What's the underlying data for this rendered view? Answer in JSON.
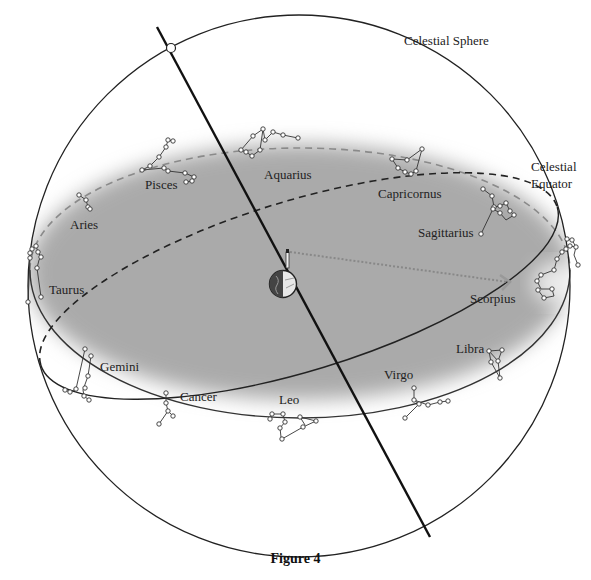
{
  "figure": {
    "caption": "Figure 4",
    "labels": {
      "celestial_sphere": "Celestial Sphere",
      "celestial_equator_line1": "Celestial",
      "celestial_equator_line2": "Equator"
    },
    "constellations": [
      {
        "name": "Pisces",
        "x": 145,
        "y": 178
      },
      {
        "name": "Aquarius",
        "x": 264,
        "y": 172
      },
      {
        "name": "Capricornus",
        "x": 377,
        "y": 191
      },
      {
        "name": "Aries",
        "x": 70,
        "y": 222
      },
      {
        "name": "Sagittarius",
        "x": 418,
        "y": 230
      },
      {
        "name": "Taurus",
        "x": 49,
        "y": 285
      },
      {
        "name": "Scorpius",
        "x": 470,
        "y": 296
      },
      {
        "name": "Gemini",
        "x": 100,
        "y": 361
      },
      {
        "name": "Libra",
        "x": 456,
        "y": 346
      },
      {
        "name": "Cancer",
        "x": 180,
        "y": 395
      },
      {
        "name": "Virgo",
        "x": 383,
        "y": 371
      },
      {
        "name": "Leo",
        "x": 279,
        "y": 397
      }
    ],
    "colors": {
      "line": "#222222",
      "ecliptic_plane": "#a9a9a9",
      "ecliptic_dash": "#8a8a8a",
      "sight_arrow": "#888888",
      "background": "#ffffff"
    }
  }
}
